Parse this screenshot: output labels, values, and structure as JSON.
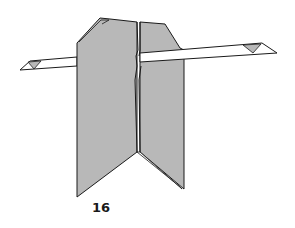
{
  "diagram": {
    "type": "origami-step",
    "step_number": "16",
    "colors": {
      "paper_gray": "#b8b8b8",
      "paper_white": "#ffffff",
      "line": "#1a1a1a"
    },
    "elements": [
      "left-panel",
      "right-panel",
      "center-fold",
      "horizontal-strip-left",
      "horizontal-strip-right",
      "left-strip-tip-triangle",
      "right-strip-tip-triangle"
    ]
  }
}
